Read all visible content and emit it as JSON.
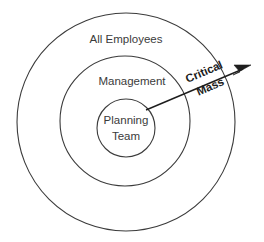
{
  "diagram": {
    "type": "concentric-circles",
    "background_color": "#ffffff",
    "stroke_color": "#3b3b3b",
    "arrow_color": "#1d1d1d",
    "rings": [
      {
        "id": "outer",
        "label": "All Employees",
        "cx": 126,
        "cy": 122,
        "r": 109,
        "label_x": 126,
        "label_y": 40
      },
      {
        "id": "middle",
        "label": "Management",
        "cx": 125,
        "cy": 121,
        "r": 65,
        "label_x": 132,
        "label_y": 82
      },
      {
        "id": "inner",
        "label_line1": "Planning",
        "label_line2": "Team",
        "cx": 126,
        "cy": 128,
        "r": 29,
        "label_x": 126,
        "label_y": 121
      }
    ],
    "arrow": {
      "label_line1": "Critical",
      "label_line2": "Mass",
      "x1": 146,
      "y1": 110,
      "x2": 250,
      "y2": 66,
      "angle_deg": -23,
      "label_x": 207,
      "label_y": 79
    }
  }
}
